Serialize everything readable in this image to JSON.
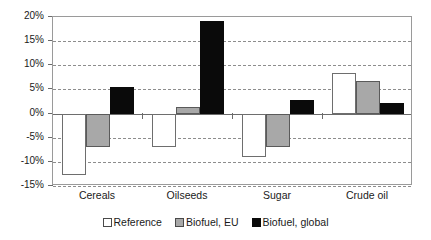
{
  "chart_data": {
    "type": "bar",
    "title": "",
    "xlabel": "",
    "ylabel": "",
    "categories": [
      "Cereals",
      "Oilseeds",
      "Sugar",
      "Crude oil"
    ],
    "series": [
      {
        "name": "Reference",
        "color": "#ffffff",
        "values": [
          -12.8,
          -6.9,
          -9.0,
          8.4
        ]
      },
      {
        "name": "Biofuel, EU",
        "color": "#a8a8a8",
        "values": [
          -7.0,
          1.3,
          -7.0,
          6.8
        ]
      },
      {
        "name": "Biofuel, global",
        "color": "#0a0a0a",
        "values": [
          5.4,
          19.2,
          2.8,
          2.1
        ]
      }
    ],
    "ylim": [
      -15,
      20
    ],
    "yticks": [
      20,
      15,
      10,
      5,
      0,
      -5,
      -10,
      -15
    ],
    "ytick_labels": [
      "20%",
      "15%",
      "10%",
      "5%",
      "0%",
      "-5%",
      "-10%",
      "-15%"
    ],
    "grid": true,
    "grid_style": "dashed-horizontal",
    "legend_position": "bottom-center",
    "value_suffix": "%"
  },
  "axis": {
    "y": {
      "labels": [
        "20%",
        "15%",
        "10%",
        "5%",
        "0%",
        "-5%",
        "-10%",
        "-15%"
      ]
    },
    "x": {
      "labels": [
        "Cereals",
        "Oilseeds",
        "Sugar",
        "Crude oil"
      ]
    }
  },
  "legend": {
    "items": [
      {
        "label": "Reference"
      },
      {
        "label": "Biofuel, EU"
      },
      {
        "label": "Biofuel, global"
      }
    ]
  }
}
